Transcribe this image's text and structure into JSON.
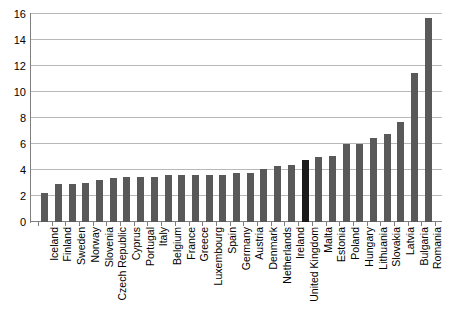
{
  "chart_data": {
    "type": "bar",
    "title": "",
    "subtitle": "",
    "xlabel": "",
    "ylabel": "",
    "ylim": [
      0,
      16
    ],
    "ytick_step": 2,
    "yticks": [
      0,
      2,
      4,
      6,
      8,
      10,
      12,
      14,
      16
    ],
    "grid": true,
    "legend": "none",
    "orientation": "vertical",
    "label_rotation": -90,
    "bar_color": "#595959",
    "highlight_color": "#1a1a1a",
    "highlight_category": "United Kingdom",
    "categories": [
      "Iceland",
      "Finland",
      "Sweden",
      "Norway",
      "Slovenia",
      "Czech Republic",
      "Cyprus",
      "Portugal",
      "Italy",
      "Belgium",
      "France",
      "Greece",
      "Luxembourg",
      "Spain",
      "Germany",
      "Austria",
      "Denmark",
      "Netherlands",
      "Ireland",
      "United Kingdom",
      "Malta",
      "Estonia",
      "Poland",
      "Hungary",
      "Lithuania",
      "Slovakia",
      "Latvia",
      "Bulgaria",
      "Romania"
    ],
    "values": [
      2.2,
      2.9,
      2.9,
      3.0,
      3.2,
      3.4,
      3.5,
      3.5,
      3.5,
      3.6,
      3.6,
      3.6,
      3.6,
      3.6,
      3.8,
      3.8,
      4.1,
      4.3,
      4.4,
      4.8,
      5.0,
      5.1,
      6.0,
      6.0,
      6.5,
      6.8,
      7.7,
      11.5,
      15.7
    ]
  }
}
